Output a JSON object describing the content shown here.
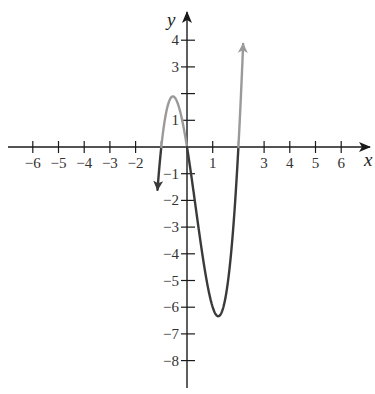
{
  "chart_data": {
    "type": "line",
    "title": "",
    "xlabel": "x",
    "ylabel": "y",
    "function": "f(x) = 3x(x+1)(x-2) = 3x^3 - 3x^2 - 6x",
    "xlim": [
      -6.3,
      6.9
    ],
    "ylim": [
      -8.9,
      5.0
    ],
    "x_ticks": [
      -6,
      -5,
      -4,
      -3,
      -2,
      -1,
      1,
      2,
      3,
      4,
      5,
      6
    ],
    "x_tick_labels": [
      "-6",
      "-5",
      "-4",
      "-3",
      "-2",
      "",
      "1",
      "",
      "3",
      "4",
      "5",
      "6"
    ],
    "y_ticks": [
      4,
      3,
      2,
      1,
      -1,
      -2,
      -3,
      -4,
      -5,
      -6,
      -7,
      -8
    ],
    "y_tick_labels": [
      "4",
      "3",
      "",
      "1",
      "-1",
      "-2",
      "-3",
      "-4",
      "-5",
      "-6",
      "-7",
      "-8"
    ],
    "grid": false,
    "legend": null,
    "annotations": [],
    "key_points": {
      "x_intercepts": [
        -1,
        0,
        2
      ],
      "local_max": {
        "x": -0.55,
        "y": 1.9
      },
      "local_min": {
        "x": 1.22,
        "y": -6.3
      }
    },
    "series": [
      {
        "name": "f(x)",
        "x": [
          -1.15,
          -1.0,
          -0.8,
          -0.6,
          -0.55,
          -0.4,
          -0.2,
          0,
          0.2,
          0.4,
          0.6,
          0.8,
          1.0,
          1.22,
          1.4,
          1.6,
          1.8,
          2.0,
          2.1,
          2.2
        ],
        "y": [
          -8.5,
          0,
          1.78,
          1.87,
          1.88,
          1.73,
          1.06,
          0,
          -1.3,
          -2.69,
          -3.98,
          -5.06,
          -6.0,
          -6.3,
          -6.05,
          -4.99,
          -3.02,
          0,
          1.3,
          2.77
        ],
        "positive_color": "#9a9a9a",
        "negative_color": "#3a3a3a",
        "arrows": [
          "start",
          "end"
        ]
      }
    ],
    "colors": {
      "axis": "#1a1a1a",
      "positive_part": "#9a9a9a",
      "negative_part": "#3a3a3a",
      "text": "#333333"
    }
  }
}
